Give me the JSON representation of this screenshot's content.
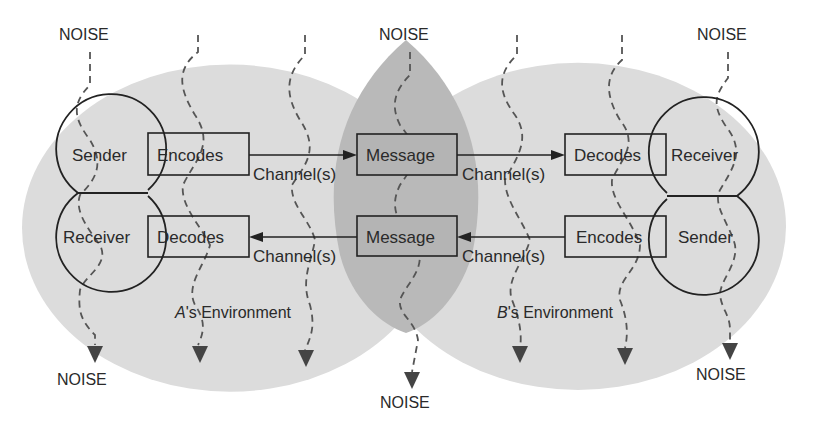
{
  "diagram": {
    "type": "communication-model",
    "colors": {
      "background": "#ffffff",
      "environment_fill": "#dcdcdc",
      "overlap_fill": "#b9b9b9",
      "message_box_fill": "#b4b4b4",
      "stroke": "#222222",
      "noise_line": "#555555"
    },
    "left_party": {
      "environment_label_prefix": "A",
      "environment_label_suffix": "'s Environment",
      "top_head": "Sender",
      "bottom_head": "Receiver",
      "top_process": "Encodes",
      "bottom_process": "Decodes"
    },
    "right_party": {
      "environment_label_prefix": "B",
      "environment_label_suffix": "'s Environment",
      "top_head": "Receiver",
      "bottom_head": "Sender",
      "top_process": "Decodes",
      "bottom_process": "Encodes"
    },
    "shared": {
      "top_message": "Message",
      "bottom_message": "Message"
    },
    "channels": {
      "top_left": "Channel(s)",
      "top_right": "Channel(s)",
      "bottom_left": "Channel(s)",
      "bottom_right": "Channel(s)"
    },
    "noise": {
      "top_left": "NOISE",
      "top_center": "NOISE",
      "top_right": "NOISE",
      "bottom_left": "NOISE",
      "bottom_center": "NOISE",
      "bottom_right": "NOISE"
    }
  }
}
